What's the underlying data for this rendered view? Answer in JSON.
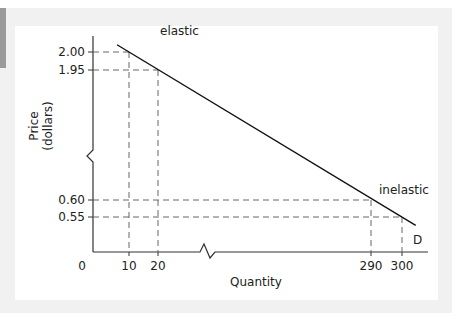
{
  "chart_data": {
    "type": "line",
    "title": "",
    "xlabel": "Quantity",
    "ylabel": "Price (dollars)",
    "ylabel_lines": [
      "Price",
      "(dollars)"
    ],
    "origin_label": "0",
    "x_ticks": [
      {
        "value": 10,
        "label": "10"
      },
      {
        "value": 20,
        "label": "20"
      },
      {
        "value": 290,
        "label": "290"
      },
      {
        "value": 300,
        "label": "300"
      }
    ],
    "y_ticks": [
      {
        "value": 2.0,
        "label": "2.00"
      },
      {
        "value": 1.95,
        "label": "1.95"
      },
      {
        "value": 0.6,
        "label": "0.60"
      },
      {
        "value": 0.55,
        "label": "0.55"
      }
    ],
    "axis_breaks": {
      "x": true,
      "y": true
    },
    "series": [
      {
        "name": "D",
        "label": "D",
        "points": [
          [
            10,
            2.0
          ],
          [
            20,
            1.95
          ],
          [
            290,
            0.6
          ],
          [
            300,
            0.55
          ]
        ]
      }
    ],
    "annotations": [
      {
        "text": "elastic",
        "near": [
          20,
          1.95
        ]
      },
      {
        "text": "inelastic",
        "near": [
          290,
          0.6
        ]
      }
    ],
    "reference_lines": [
      {
        "type": "dashed",
        "x": 10,
        "y": 2.0
      },
      {
        "type": "dashed",
        "x": 20,
        "y": 1.95
      },
      {
        "type": "dashed",
        "x": 290,
        "y": 0.6
      },
      {
        "type": "dashed",
        "x": 300,
        "y": 0.55
      }
    ],
    "grid": false,
    "legend": "none",
    "colors": {
      "line": "#111111",
      "axis": "#333333",
      "dash": "#666666",
      "panel_bg": "#ffffff",
      "frame_bg": "#f1f1f1"
    }
  }
}
